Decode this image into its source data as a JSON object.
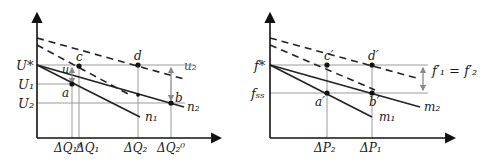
{
  "colors": {
    "axis": "#111111",
    "solid_line": "#222222",
    "dashed_line": "#222222",
    "guide_line": "#9a9a9a",
    "arrow_grey": "#8a8a8a",
    "point": "#111111"
  },
  "left_chart": {
    "y_labels": {
      "u_star": "U*",
      "u1": "U₁",
      "u2": "U₂"
    },
    "x_labels": {
      "dq1_0": "ΔQ₁⁰",
      "dq1": "ΔQ₁",
      "dq2": "ΔQ₂",
      "dq2_0": "ΔQ₂⁰"
    },
    "line_labels": {
      "n1": "n₁",
      "n2": "n₂",
      "u2": "u₂",
      "u": "u"
    },
    "point_labels": {
      "a": "a",
      "b": "b",
      "c": "c",
      "d": "d"
    }
  },
  "right_chart": {
    "y_labels": {
      "f_star": "f*",
      "f_ss": "fₛₛ"
    },
    "x_labels": {
      "dp2": "ΔP₂",
      "dp1": "ΔP₁"
    },
    "line_labels": {
      "m1": "m₁",
      "m2": "m₂"
    },
    "annotation": "f′₁ = f′₂",
    "point_labels": {
      "a_prime": "a′",
      "b_prime": "b′",
      "c_prime": "c′",
      "d_prime": "d′"
    }
  }
}
